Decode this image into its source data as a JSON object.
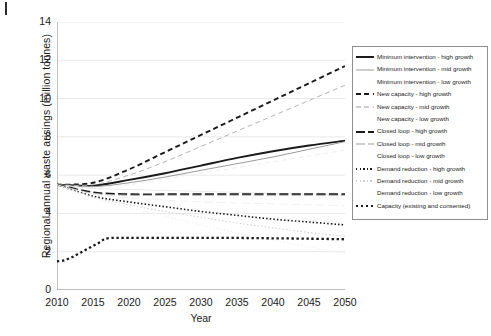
{
  "axes": {
    "ylabel": "Regional annual waste arisings (million tonnes)",
    "xlabel": "Year",
    "yticks": [
      "0",
      "2",
      "4",
      "6",
      "8",
      "10",
      "12",
      "14"
    ],
    "xticks": [
      "2010",
      "2015",
      "2020",
      "2025",
      "2030",
      "2035",
      "2040",
      "2045",
      "2050"
    ]
  },
  "legend": {
    "items": [
      {
        "label": "Minimum intervention - high growth",
        "style": "solid-thick",
        "color": "#1a1a1a"
      },
      {
        "label": "Minimum intervention - mid growth",
        "style": "solid-thin",
        "color": "#9a9a9a"
      },
      {
        "label": "Minimum intervention - low growth",
        "style": "none",
        "color": "#ffffff"
      },
      {
        "label": "New capacity - high growth",
        "style": "dashed-thick",
        "color": "#1a1a1a"
      },
      {
        "label": "New capacity - mid growth",
        "style": "dashed-thin",
        "color": "#9a9a9a"
      },
      {
        "label": "New capacity - low growth",
        "style": "none",
        "color": "#ffffff"
      },
      {
        "label": "Closed loop - high growth",
        "style": "dashdot-thick",
        "color": "#1a1a1a"
      },
      {
        "label": "Closed loop - mid growth",
        "style": "dashdot-thin",
        "color": "#9a9a9a"
      },
      {
        "label": "Closed loop - low growth",
        "style": "none",
        "color": "#ffffff"
      },
      {
        "label": "Demand reduction - high growth",
        "style": "dotted-thick",
        "color": "#1a1a1a"
      },
      {
        "label": "Demand reduction - mid growth",
        "style": "dotted-thin",
        "color": "#9a9a9a"
      },
      {
        "label": "Demand reduction - low growth",
        "style": "none",
        "color": "#ffffff"
      },
      {
        "label": "Capacity (existing and consented)",
        "style": "dotted-sq",
        "color": "#1a1a1a"
      }
    ]
  },
  "chart_data": {
    "type": "line",
    "title": "",
    "xlabel": "Year",
    "ylabel": "Regional annual waste arisings (million tonnes)",
    "xlim": [
      2010,
      2050
    ],
    "ylim": [
      0,
      14
    ],
    "grid": "horizontal",
    "legend_position": "right-outside",
    "x": [
      2010,
      2015,
      2020,
      2025,
      2030,
      2035,
      2040,
      2045,
      2050
    ],
    "series": [
      {
        "name": "Minimum intervention - high growth",
        "style": "solid-thick",
        "color": "#1a1a1a",
        "values": [
          5.5,
          5.45,
          5.75,
          6.1,
          6.5,
          6.9,
          7.25,
          7.55,
          7.8
        ]
      },
      {
        "name": "Minimum intervention - mid growth",
        "style": "solid-thin",
        "color": "#9a9a9a",
        "values": [
          5.5,
          5.4,
          5.6,
          5.9,
          6.25,
          6.6,
          6.95,
          7.35,
          7.75
        ]
      },
      {
        "name": "Minimum intervention - low growth",
        "style": "solid-faint",
        "color": "#e8e8e8",
        "values": [
          5.5,
          5.3,
          5.25,
          5.2,
          5.15,
          5.1,
          5.05,
          5.0,
          4.95
        ]
      },
      {
        "name": "New capacity - high growth",
        "style": "dashed-thick",
        "color": "#1a1a1a",
        "values": [
          5.5,
          5.6,
          6.3,
          7.2,
          8.1,
          9.0,
          9.9,
          10.8,
          11.7
        ]
      },
      {
        "name": "New capacity - mid growth",
        "style": "dashed-thin",
        "color": "#b5b5b5",
        "values": [
          5.5,
          5.5,
          6.0,
          6.7,
          7.5,
          8.3,
          9.1,
          9.9,
          10.7
        ]
      },
      {
        "name": "New capacity - low growth",
        "style": "dashed-faint",
        "color": "#ececec",
        "values": [
          5.5,
          5.35,
          5.5,
          5.8,
          6.1,
          6.4,
          6.7,
          7.0,
          7.3
        ]
      },
      {
        "name": "Closed loop - high growth",
        "style": "dashdot-thick",
        "color": "#1a1a1a",
        "values": [
          5.5,
          5.1,
          5.0,
          5.0,
          5.0,
          5.0,
          5.0,
          5.0,
          5.0
        ]
      },
      {
        "name": "Closed loop - mid growth",
        "style": "dashdot-thin",
        "color": "#bdbdbd",
        "values": [
          5.5,
          5.05,
          4.95,
          4.95,
          4.95,
          4.95,
          4.95,
          4.95,
          4.95
        ]
      },
      {
        "name": "Closed loop - low growth",
        "style": "dashdot-faint",
        "color": "#efefef",
        "values": [
          5.5,
          5.0,
          4.8,
          4.7,
          4.6,
          4.55,
          4.5,
          4.45,
          4.4
        ]
      },
      {
        "name": "Demand reduction - high growth",
        "style": "dotted-thick",
        "color": "#1a1a1a",
        "values": [
          5.5,
          4.9,
          4.6,
          4.35,
          4.1,
          3.9,
          3.7,
          3.55,
          3.4
        ]
      },
      {
        "name": "Demand reduction - mid growth",
        "style": "dotted-thin",
        "color": "#cfcfcf",
        "values": [
          5.5,
          4.85,
          4.45,
          4.1,
          3.8,
          3.5,
          3.25,
          3.0,
          2.8
        ]
      },
      {
        "name": "Demand reduction - low growth",
        "style": "dotted-faint",
        "color": "#ededed",
        "values": [
          5.5,
          4.8,
          4.3,
          3.85,
          3.4,
          3.0,
          2.6,
          2.25,
          1.9
        ]
      },
      {
        "name": "Capacity (existing and consented)",
        "style": "dotted-sq",
        "color": "#1a1a1a",
        "x": [
          2010,
          2011,
          2012,
          2013,
          2014,
          2015,
          2016,
          2017,
          2020,
          2025,
          2030,
          2035,
          2040,
          2045,
          2050
        ],
        "values": [
          1.5,
          1.55,
          1.7,
          1.9,
          2.1,
          2.3,
          2.5,
          2.7,
          2.72,
          2.72,
          2.72,
          2.72,
          2.7,
          2.68,
          2.65
        ]
      }
    ]
  }
}
